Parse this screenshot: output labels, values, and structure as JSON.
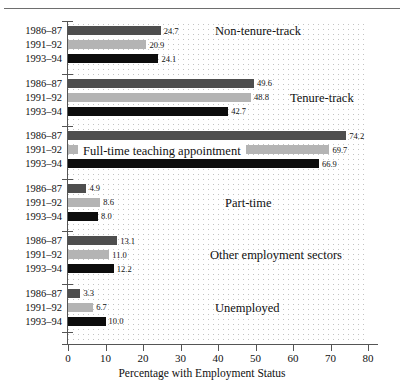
{
  "figure": {
    "axis_title": "Percentage with Employment Status",
    "series_labels": [
      "1986–87",
      "1991–92",
      "1993–94"
    ],
    "series_colors": [
      "#4e4e4e",
      "#b4b4b4",
      "#0d0d0d"
    ]
  },
  "chart_data": {
    "type": "bar",
    "orientation": "horizontal",
    "title": "",
    "xlabel": "Percentage with Employment Status",
    "ylabel": "",
    "xlim": [
      0,
      80
    ],
    "xticks": [
      0,
      10,
      20,
      30,
      40,
      50,
      60,
      70,
      80
    ],
    "xtick_labels": [
      "0",
      "10",
      "20",
      "30",
      "40",
      "50",
      "60",
      "70",
      "80"
    ],
    "grid": true,
    "legend_position": "none",
    "categories": [
      "Non-tenure-track",
      "Tenure-track",
      "Full-time teaching appointment",
      "Part-time",
      "Other employment sectors",
      "Unemployed"
    ],
    "series": [
      {
        "name": "1986–87",
        "color": "#4e4e4e",
        "values": [
          24.7,
          49.6,
          74.2,
          4.9,
          13.1,
          3.3
        ]
      },
      {
        "name": "1991–92",
        "color": "#b4b4b4",
        "values": [
          20.9,
          48.8,
          69.7,
          8.6,
          11.0,
          6.7
        ]
      },
      {
        "name": "1993–94",
        "color": "#0d0d0d",
        "values": [
          24.1,
          42.7,
          66.9,
          8.0,
          12.2,
          10.0
        ]
      }
    ],
    "value_labels": [
      [
        "24.7",
        "20.9",
        "24.1"
      ],
      [
        "49.6",
        "48.8",
        "42.7"
      ],
      [
        "74.2",
        "69.7",
        "66.9"
      ],
      [
        "4.9",
        "8.6",
        "8.0"
      ],
      [
        "13.1",
        "11.0",
        "12.2"
      ],
      [
        "3.3",
        "6.7",
        "10.0"
      ]
    ]
  }
}
